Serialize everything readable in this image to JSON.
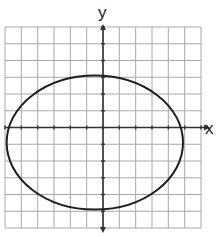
{
  "chart_data": {
    "type": "diagram",
    "title": "",
    "xlabel": "x",
    "ylabel": "y",
    "grid": true,
    "grid_cells": {
      "columns": 12,
      "rows": 12
    },
    "x_range": [
      -6,
      6
    ],
    "y_range": [
      -6,
      6
    ],
    "axes": {
      "x_axis_arrow": "right",
      "y_axis_arrow": "both"
    },
    "shapes": [
      {
        "kind": "ellipse",
        "center": [
          -0.5,
          -0.9
        ],
        "semi_axis_x": 5.4,
        "semi_axis_y": 4.0,
        "extents": {
          "left": -5.9,
          "right": 4.9,
          "top": 3.1,
          "bottom": -4.9
        }
      }
    ]
  },
  "labels": {
    "x": "x",
    "y": "y"
  },
  "colors": {
    "grid": "#a8a8a8",
    "axis": "#333333",
    "curve": "#1e1e1e",
    "background": "#ffffff"
  }
}
